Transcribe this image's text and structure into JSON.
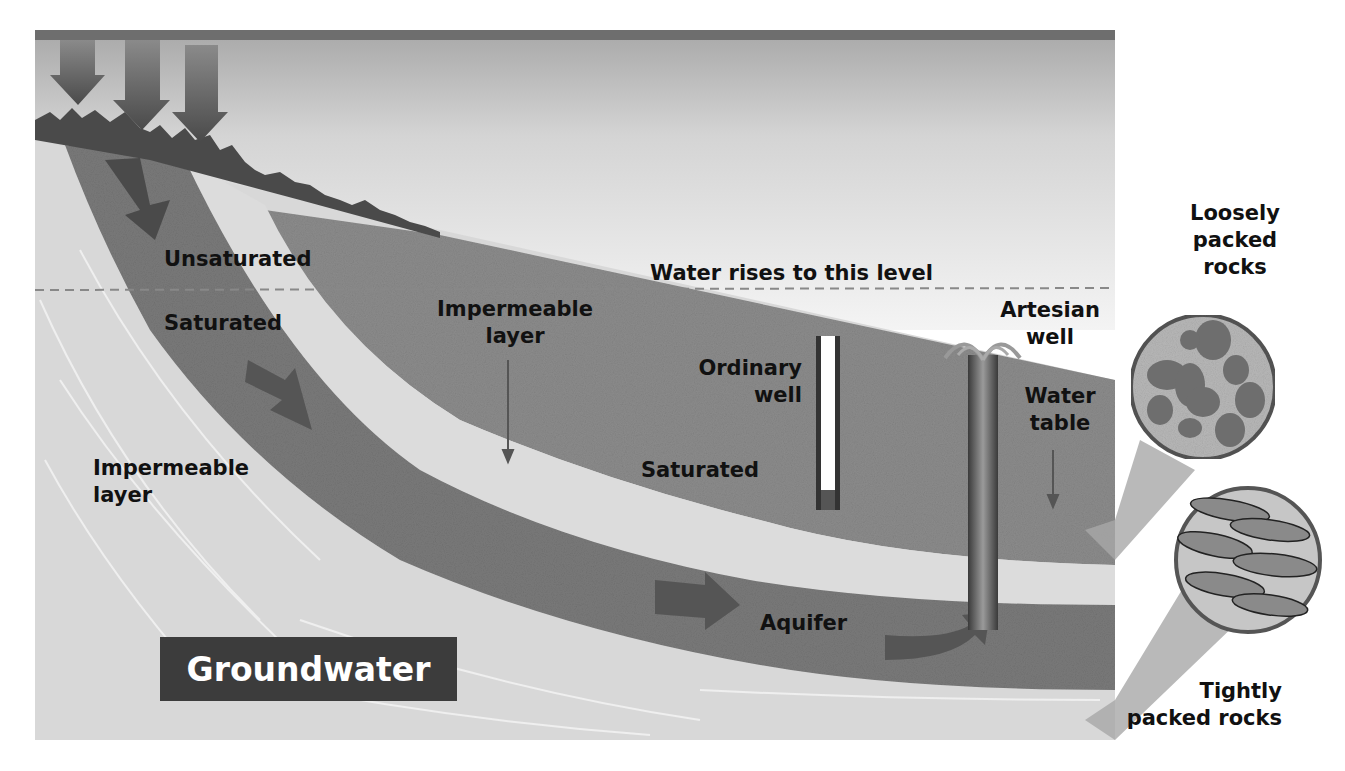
{
  "diagram": {
    "title": "Groundwater",
    "labels": {
      "unsaturated": "Unsaturated",
      "saturated_left": "Saturated",
      "impermeable_left_line1": "Impermeable",
      "impermeable_left_line2": "layer",
      "impermeable_mid_line1": "Impermeable",
      "impermeable_mid_line2": "layer",
      "water_rises": "Water rises to this level",
      "ordinary_well_line1": "Ordinary",
      "ordinary_well_line2": "well",
      "saturated_mid": "Saturated",
      "artesian_line1": "Artesian",
      "artesian_line2": "well",
      "water_table_line1": "Water",
      "water_table_line2": "table",
      "aquifer": "Aquifer",
      "loose_line1": "Loosely",
      "loose_line2": "packed",
      "loose_line3": "rocks",
      "tight_line1": "Tightly",
      "tight_line2": "packed rocks"
    },
    "colors": {
      "sky_top": "#6e6e6e",
      "sky": "#d9d9d9",
      "aquifer": "#7d7d7d",
      "saturated": "#8e8e8e",
      "impermeable": "#d6d6d6",
      "arrow": "#505050",
      "title_bg": "#3c3c3c"
    }
  }
}
